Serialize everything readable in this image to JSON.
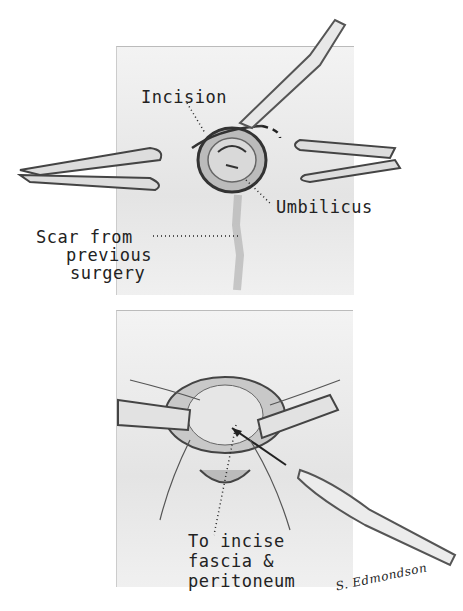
{
  "figure": {
    "top_panel": {
      "labels": {
        "incision": "Incision",
        "umbilicus": "Umbilicus",
        "scar": [
          "Scar from",
          "previous",
          "surgery"
        ]
      }
    },
    "bottom_panel": {
      "labels": {
        "instruction": [
          "To incise",
          "fascia &",
          "peritoneum"
        ]
      }
    },
    "signature": "S. Edmondson"
  }
}
